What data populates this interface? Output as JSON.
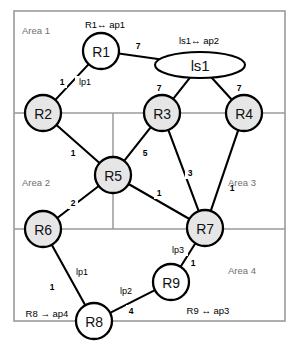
{
  "diagram": {
    "type": "network-topology",
    "canvas": {
      "width": 298,
      "height": 345
    },
    "colors": {
      "node_fill_gray": "#e6e6e6",
      "node_fill_white": "#ffffff",
      "node_stroke": "#000000",
      "link_stroke": "#000000",
      "area_frame_stroke": "#9a9a9a",
      "area_label_color": "#6f6f6f",
      "background": "#ffffff"
    },
    "frame": {
      "x": 14,
      "y": 11,
      "width": 271,
      "height": 310
    },
    "dividers": [
      {
        "name": "divider-horizontal-upper",
        "x1": 14,
        "y1": 113,
        "x2": 285,
        "y2": 113
      },
      {
        "name": "divider-horizontal-lower",
        "x1": 14,
        "y1": 229,
        "x2": 285,
        "y2": 229
      },
      {
        "name": "divider-vertical-middle",
        "x1": 113,
        "y1": 113,
        "x2": 113,
        "y2": 229
      }
    ],
    "areas": [
      {
        "id": "area1",
        "label": "Area 1",
        "x": 22,
        "y": 30
      },
      {
        "id": "area2",
        "label": "Area 2",
        "x": 22,
        "y": 182
      },
      {
        "id": "area3",
        "label": "Area 3",
        "x": 228,
        "y": 182
      },
      {
        "id": "area4",
        "label": "Area 4",
        "x": 228,
        "y": 270
      }
    ],
    "nodes": [
      {
        "id": "R1",
        "label": "R1",
        "shape": "circle",
        "cx": 101,
        "cy": 51,
        "r": 18,
        "fill": "white"
      },
      {
        "id": "ls1",
        "label": "ls1",
        "shape": "ellipse",
        "cx": 200,
        "cy": 65,
        "rx": 45,
        "ry": 13,
        "fill": "white"
      },
      {
        "id": "R2",
        "label": "R2",
        "shape": "circle",
        "cx": 43,
        "cy": 113,
        "r": 18,
        "fill": "gray"
      },
      {
        "id": "R3",
        "label": "R3",
        "shape": "circle",
        "cx": 162,
        "cy": 113,
        "r": 18,
        "fill": "gray"
      },
      {
        "id": "R4",
        "label": "R4",
        "shape": "circle",
        "cx": 244,
        "cy": 113,
        "r": 18,
        "fill": "gray"
      },
      {
        "id": "R5",
        "label": "R5",
        "shape": "circle",
        "cx": 113,
        "cy": 175,
        "r": 18,
        "fill": "gray"
      },
      {
        "id": "R6",
        "label": "R6",
        "shape": "circle",
        "cx": 43,
        "cy": 229,
        "r": 18,
        "fill": "gray"
      },
      {
        "id": "R7",
        "label": "R7",
        "shape": "circle",
        "cx": 205,
        "cy": 228,
        "r": 18,
        "fill": "gray"
      },
      {
        "id": "R9",
        "label": "R9",
        "shape": "circle",
        "cx": 171,
        "cy": 282,
        "r": 18,
        "fill": "white"
      },
      {
        "id": "R8",
        "label": "R8",
        "shape": "circle",
        "cx": 94,
        "cy": 321,
        "r": 18,
        "fill": "white"
      }
    ],
    "links": [
      {
        "id": "R1-ls1",
        "from": "R1",
        "to": "ls1",
        "weight": "7",
        "weight_x": 138,
        "weight_y": 46
      },
      {
        "id": "R1-R2",
        "from": "R1",
        "to": "R2",
        "weight": "1",
        "weight_x": 62,
        "weight_y": 82
      },
      {
        "id": "ls1-R3",
        "from": "ls1",
        "to": "R3",
        "weight": "7",
        "weight_x": 159,
        "weight_y": 88
      },
      {
        "id": "ls1-R4",
        "from": "ls1",
        "to": "R4",
        "weight": "7",
        "weight_x": 239,
        "weight_y": 88
      },
      {
        "id": "R2-R5",
        "from": "R2",
        "to": "R5",
        "weight": "1",
        "weight_x": 73,
        "weight_y": 153
      },
      {
        "id": "R3-R5",
        "from": "R3",
        "to": "R5",
        "weight": "5",
        "weight_x": 145,
        "weight_y": 153
      },
      {
        "id": "R3-R7",
        "from": "R3",
        "to": "R7",
        "weight": "3",
        "weight_x": 190,
        "weight_y": 173
      },
      {
        "id": "R4-R7",
        "from": "R4",
        "to": "R7",
        "weight": "1",
        "weight_x": 232,
        "weight_y": 188
      },
      {
        "id": "R5-R7",
        "from": "R5",
        "to": "R7",
        "weight": "1",
        "weight_x": 159,
        "weight_y": 193
      },
      {
        "id": "R5-R6",
        "from": "R5",
        "to": "R6",
        "weight": "2",
        "weight_x": 73,
        "weight_y": 203
      },
      {
        "id": "R6-R8",
        "from": "R6",
        "to": "R8",
        "weight": "1",
        "weight_x": 52,
        "weight_y": 287
      },
      {
        "id": "R8-R9",
        "from": "R8",
        "to": "R9",
        "weight": "4",
        "weight_x": 131,
        "weight_y": 311
      },
      {
        "id": "R7-R9",
        "from": "R7",
        "to": "R9",
        "weight": "1",
        "weight_x": 193,
        "weight_y": 263
      }
    ],
    "port_labels": [
      {
        "id": "lp1-top",
        "text": "lp1",
        "x": 85,
        "y": 82
      },
      {
        "id": "lp1-bottom",
        "text": "lp1",
        "x": 82,
        "y": 272
      },
      {
        "id": "lp2",
        "text": "lp2",
        "x": 126,
        "y": 291
      },
      {
        "id": "lp3",
        "text": "lp3",
        "x": 178,
        "y": 250
      }
    ],
    "endpoint_labels": [
      {
        "id": "r1-ap1",
        "text": "R1↔ ap1",
        "x": 105,
        "y": 24
      },
      {
        "id": "ls1-ap2",
        "text": "ls1↔ ap2",
        "x": 199,
        "y": 40
      },
      {
        "id": "r8-ap4",
        "text": "R8 → ap4",
        "x": 47,
        "y": 313
      },
      {
        "id": "r9-ap3",
        "text": "R9 ↔ ap3",
        "x": 208,
        "y": 310
      }
    ]
  }
}
